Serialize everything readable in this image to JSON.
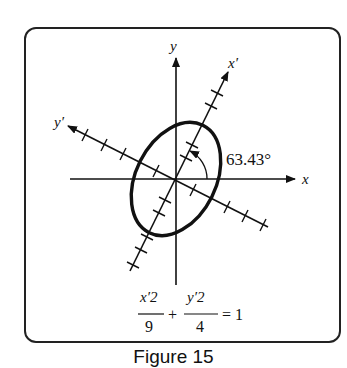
{
  "figure": {
    "axes": {
      "x_label": "x",
      "y_label": "y",
      "x_prime_label": "x′",
      "y_prime_label": "y′"
    },
    "rotation_angle_label": "63.43°",
    "equation": {
      "term1_numerator": "x′2",
      "term1_denominator": "9",
      "operator": "+",
      "term2_numerator": "y′2",
      "term2_denominator": "4",
      "rhs": "= 1"
    },
    "caption": "Figure 15",
    "colors": {
      "stroke": "#111111",
      "background": "#ffffff"
    },
    "ellipse": {
      "a_squared": 9,
      "b_squared": 4,
      "rotation_deg": 63.43
    }
  }
}
